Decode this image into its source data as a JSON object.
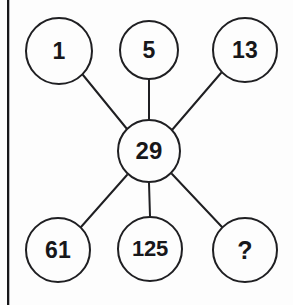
{
  "diagram": {
    "type": "radial-node-graph",
    "canvas": {
      "width": 293,
      "height": 305,
      "background": "#fdfdfd"
    },
    "style": {
      "node_stroke_color": "#1f1f22",
      "node_fill_color": "#fdfdfd",
      "edge_color": "#1f1f22",
      "text_color": "#17171a",
      "node_stroke_width": 2,
      "edge_width": 2
    },
    "page_edge": {
      "name": "page-border-line",
      "color": "#17171a",
      "x": 7
    },
    "center_node": {
      "id": "center",
      "label": "29",
      "cx": 149,
      "cy": 151,
      "r": 32
    },
    "outer_nodes": [
      {
        "id": "n1",
        "label": "1",
        "cx": 59,
        "cy": 51,
        "r": 34,
        "position": "top-left"
      },
      {
        "id": "n5",
        "label": "5",
        "cx": 149,
        "cy": 50,
        "r": 30,
        "position": "top-center"
      },
      {
        "id": "n13",
        "label": "13",
        "cx": 245,
        "cy": 50,
        "r": 33,
        "position": "top-right"
      },
      {
        "id": "n61",
        "label": "61",
        "cx": 58,
        "cy": 250,
        "r": 33,
        "position": "bottom-left"
      },
      {
        "id": "n125",
        "label": "125",
        "cx": 150,
        "cy": 249,
        "r": 33,
        "position": "bottom-center"
      },
      {
        "id": "nq",
        "label": "?",
        "cx": 245,
        "cy": 250,
        "r": 33,
        "position": "bottom-right"
      }
    ],
    "edges": [
      {
        "from": "n1",
        "to": "center",
        "x1": 83,
        "y1": 75,
        "x2": 127,
        "y2": 129
      },
      {
        "from": "n5",
        "to": "center",
        "x1": 149,
        "y1": 80,
        "x2": 149,
        "y2": 119
      },
      {
        "from": "n13",
        "to": "center",
        "x1": 221,
        "y1": 73,
        "x2": 172,
        "y2": 130
      },
      {
        "from": "n61",
        "to": "center",
        "x1": 81,
        "y1": 227,
        "x2": 127,
        "y2": 175
      },
      {
        "from": "n125",
        "to": "center",
        "x1": 150,
        "y1": 216,
        "x2": 149,
        "y2": 183
      },
      {
        "from": "nq",
        "to": "center",
        "x1": 222,
        "y1": 227,
        "x2": 172,
        "y2": 174
      }
    ]
  }
}
